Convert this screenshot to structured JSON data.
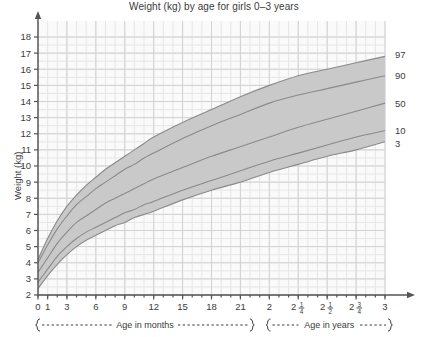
{
  "chart_data": {
    "type": "line",
    "title": "Weight (kg) by age for girls 0–3 years",
    "xlabel": "",
    "ylabel": "Weight (kg)",
    "ylim": [
      2,
      18
    ],
    "xlim_months": [
      0,
      36
    ],
    "grid": true,
    "legend_position": "right",
    "y_ticks": [
      "18",
      "17",
      "16",
      "15",
      "14",
      "13",
      "12",
      "11",
      "10",
      "9",
      "8",
      "7",
      "6",
      "5",
      "4",
      "3",
      "2"
    ],
    "x_ticks_months": [
      {
        "label": "0",
        "months": 0
      },
      {
        "label": "1",
        "months": 1
      },
      {
        "label": "3",
        "months": 3
      },
      {
        "label": "6",
        "months": 6
      },
      {
        "label": "9",
        "months": 9
      },
      {
        "label": "12",
        "months": 12
      },
      {
        "label": "15",
        "months": 15
      },
      {
        "label": "18",
        "months": 18
      },
      {
        "label": "21",
        "months": 21
      }
    ],
    "x_ticks_years": [
      {
        "label": "2",
        "whole": "2",
        "numerator": "",
        "denominator": "",
        "months": 24
      },
      {
        "label": "2 1/4",
        "whole": "2",
        "numerator": "1",
        "denominator": "4",
        "months": 27
      },
      {
        "label": "2 1/2",
        "whole": "2",
        "numerator": "1",
        "denominator": "2",
        "months": 30
      },
      {
        "label": "2 3/4",
        "whole": "2",
        "numerator": "3",
        "denominator": "4",
        "months": 33
      },
      {
        "label": "3",
        "whole": "3",
        "numerator": "",
        "denominator": "",
        "months": 36
      }
    ],
    "brace_months_label": "Age in months",
    "brace_years_label": "Age in years",
    "x": [
      0,
      1,
      2,
      3,
      4,
      5,
      6,
      7,
      8,
      9,
      10,
      11,
      12,
      15,
      18,
      21,
      24,
      27,
      30,
      33,
      36
    ],
    "series": [
      {
        "name": "97",
        "label": "97",
        "values": [
          4.2,
          5.5,
          6.6,
          7.5,
          8.2,
          8.8,
          9.3,
          9.8,
          10.2,
          10.6,
          11.0,
          11.4,
          11.8,
          12.7,
          13.5,
          14.3,
          15.0,
          15.6,
          16.0,
          16.4,
          16.8
        ]
      },
      {
        "name": "90",
        "label": "90",
        "values": [
          4.0,
          5.1,
          6.1,
          6.9,
          7.6,
          8.1,
          8.6,
          9.0,
          9.4,
          9.8,
          10.1,
          10.5,
          10.8,
          11.7,
          12.5,
          13.2,
          13.9,
          14.4,
          14.8,
          15.2,
          15.6
        ]
      },
      {
        "name": "50",
        "label": "50",
        "values": [
          3.4,
          4.3,
          5.2,
          5.9,
          6.5,
          6.9,
          7.3,
          7.7,
          8.0,
          8.3,
          8.6,
          8.9,
          9.2,
          9.9,
          10.6,
          11.2,
          11.8,
          12.4,
          12.9,
          13.4,
          13.9
        ]
      },
      {
        "name": "10",
        "label": "10",
        "values": [
          2.8,
          3.6,
          4.4,
          5.0,
          5.5,
          5.9,
          6.2,
          6.5,
          6.8,
          7.1,
          7.3,
          7.6,
          7.8,
          8.5,
          9.1,
          9.7,
          10.3,
          10.8,
          11.3,
          11.8,
          12.2
        ]
      },
      {
        "name": "3",
        "label": "3",
        "values": [
          2.4,
          3.2,
          3.9,
          4.5,
          5.0,
          5.4,
          5.7,
          6.0,
          6.3,
          6.5,
          6.8,
          7.0,
          7.2,
          7.9,
          8.5,
          9.0,
          9.6,
          10.1,
          10.6,
          11.0,
          11.5
        ]
      }
    ],
    "band": {
      "lower": "3",
      "upper": "97"
    },
    "colors": {
      "band_fill": "#c9c9c9",
      "curve": "#8a8a8a",
      "major_grid": "#d2d2d2",
      "minor_grid": "#e6e6e6",
      "axis": "#555555",
      "text": "#3c3c3c",
      "plot_bg": "#fafafa",
      "page_bg": "#ffffff"
    }
  }
}
